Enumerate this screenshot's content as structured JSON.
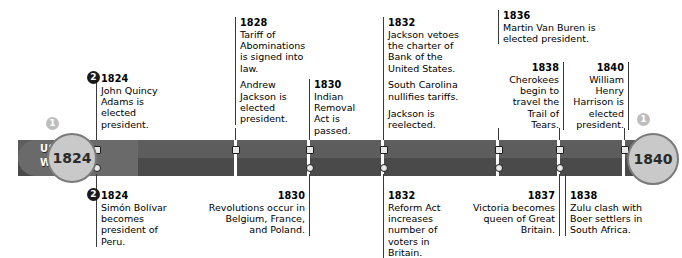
{
  "legend": {
    "top_lane": "USA",
    "bottom_lane": "World"
  },
  "timeline": {
    "start_year": "1824",
    "end_year": "1840",
    "badge_usa": "1",
    "badge_world": "2"
  },
  "usa_events": [
    {
      "year": "1824",
      "lines": [
        "John Quincy Adams is elected president."
      ]
    },
    {
      "year": "1828",
      "lines": [
        "Tariff of Abominations is signed into law.",
        "Andrew Jackson is elected president."
      ]
    },
    {
      "year": "1830",
      "lines": [
        "Indian Removal Act is passed."
      ]
    },
    {
      "year": "1832",
      "lines": [
        "Jackson vetoes the charter of Bank of the United States.",
        "South Carolina nullifies tariffs.",
        "Jackson is reelected."
      ]
    },
    {
      "year": "1836",
      "lines": [
        "Martin Van Buren is elected president."
      ]
    },
    {
      "year": "1838",
      "lines": [
        "Cherokees begin to travel the Trail of Tears."
      ]
    },
    {
      "year": "1840",
      "lines": [
        "William Henry Harrison is elected president."
      ]
    }
  ],
  "world_events": [
    {
      "year": "1824",
      "lines": [
        "Simón Bolívar becomes president of Peru."
      ]
    },
    {
      "year": "1830",
      "lines": [
        "Revolutions occur in Belgium, France, and Poland."
      ]
    },
    {
      "year": "1832",
      "lines": [
        "Reform Act increases number of voters in Britain."
      ]
    },
    {
      "year": "1837",
      "lines": [
        "Victoria becomes queen of Great Britain."
      ]
    },
    {
      "year": "1838",
      "lines": [
        "Zulu clash with Boer settlers in South Africa."
      ]
    }
  ],
  "colors": {
    "bar_usa": "#5d5d5d",
    "bar_world": "#4a4a4a",
    "endcap": "#c9c9c9",
    "badge_dark": "#1a1a1a",
    "badge_light": "#bdbdbd"
  }
}
